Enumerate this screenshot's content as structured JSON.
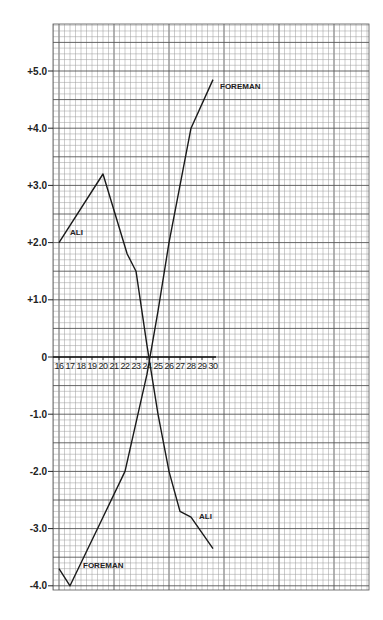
{
  "chart_data": {
    "type": "line",
    "title": "",
    "xlabel": "",
    "ylabel": "",
    "x_ticks": [
      "16",
      "17",
      "18",
      "19",
      "20",
      "21",
      "22",
      "23",
      "24",
      "25",
      "26",
      "27",
      "28",
      "29",
      "30"
    ],
    "y_ticks": [
      "+5.0",
      "+4.0",
      "+3.0",
      "+2.0",
      "+1.0",
      "0",
      "-1.0",
      "-2.0",
      "-3.0",
      "-4.0"
    ],
    "xlim": [
      16,
      30
    ],
    "ylim": [
      -4.0,
      5.5
    ],
    "grid": true,
    "series": [
      {
        "name": "ALI",
        "x": [
          16,
          20,
          22.2,
          23,
          24,
          25,
          26,
          27,
          28,
          30
        ],
        "values": [
          2.0,
          3.2,
          1.8,
          1.5,
          0.2,
          -1.0,
          -2.0,
          -2.7,
          -2.8,
          -3.35
        ]
      },
      {
        "name": "FOREMAN",
        "x": [
          16,
          17,
          20,
          22,
          24,
          25,
          26,
          27,
          28,
          30
        ],
        "values": [
          -3.7,
          -4.0,
          -2.8,
          -2.0,
          -0.3,
          0.8,
          2.0,
          3.0,
          4.0,
          4.85
        ]
      }
    ],
    "annotations": [
      {
        "text": "ALI",
        "near": "upper-left segment"
      },
      {
        "text": "ALI",
        "near": "lower-right end"
      },
      {
        "text": "FOREMAN",
        "near": "upper end"
      },
      {
        "text": "FOREMAN",
        "near": "lower-left start"
      }
    ]
  },
  "labels": {
    "ali_upper": "ALI",
    "ali_lower": "ALI",
    "foreman_upper": "FOREMAN",
    "foreman_lower": "FOREMAN"
  },
  "colors": {
    "grid_minor": "#9a9a9a",
    "grid_major": "#555555",
    "line": "#1a1a1a"
  }
}
